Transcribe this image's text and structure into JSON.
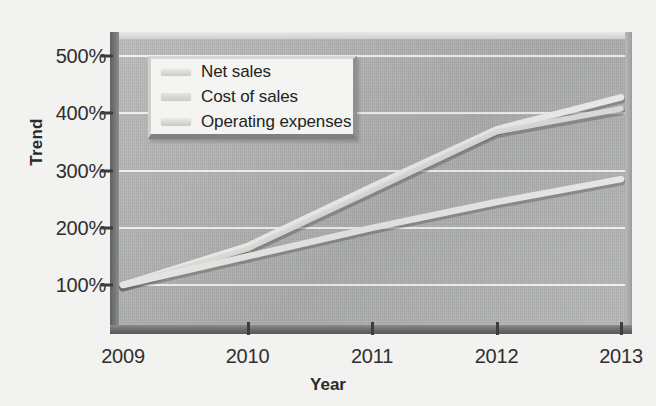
{
  "chart_data": {
    "type": "line",
    "title": "",
    "xlabel": "Year",
    "ylabel": "Trend",
    "x": [
      "2009",
      "2010",
      "2011",
      "2012",
      "2013"
    ],
    "categories": [
      "2009",
      "2010",
      "2011",
      "2012",
      "2013"
    ],
    "series": [
      {
        "name": "Net sales",
        "values": [
          100,
          168,
          272,
          372,
          428
        ],
        "color": "#f0efed"
      },
      {
        "name": "Cost of sales",
        "values": [
          100,
          163,
          265,
          368,
          408
        ],
        "color": "#e6e5e2"
      },
      {
        "name": "Operating expenses",
        "values": [
          100,
          150,
          200,
          245,
          285
        ],
        "color": "#eceae7"
      }
    ],
    "ylim": [
      0,
      500
    ],
    "yticks": [
      100,
      200,
      300,
      400,
      500
    ],
    "ytick_labels": [
      "100%",
      "200%",
      "300%",
      "400%",
      "500%"
    ],
    "xlim": [
      "2009",
      "2013"
    ],
    "grid": true,
    "grid_axis": "y",
    "grid_color": "#ffffff",
    "legend_position": "upper-left-inside",
    "plot_background": "#b2b4b4",
    "figure_background": "#f2f2f0",
    "axis_text_color": "#2f2f2f"
  },
  "axes": {
    "y_title": "Trend",
    "x_title": "Year"
  },
  "legend": {
    "items": [
      {
        "label": "Net sales"
      },
      {
        "label": "Cost of sales"
      },
      {
        "label": "Operating expenses"
      }
    ]
  }
}
